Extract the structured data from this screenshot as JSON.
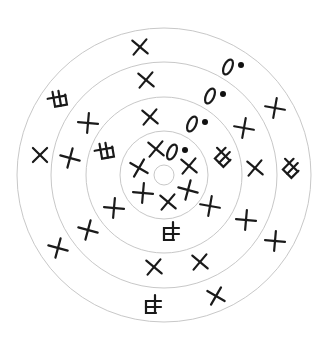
{
  "colors": {
    "ring": "#c8c8c8",
    "mark": "#1a1a1a",
    "background": "#ffffff"
  },
  "center": [
    164,
    175
  ],
  "rings": [
    147,
    113,
    78,
    44,
    10
  ],
  "crosses": [
    {
      "x": 140,
      "y": 47,
      "rot": 40
    },
    {
      "x": 146,
      "y": 80,
      "rot": 40
    },
    {
      "x": 150,
      "y": 117,
      "rot": 40
    },
    {
      "x": 88,
      "y": 123,
      "rot": 5
    },
    {
      "x": 70,
      "y": 158,
      "rot": 15
    },
    {
      "x": 40,
      "y": 155,
      "rot": 45
    },
    {
      "x": 156,
      "y": 149,
      "rot": 40
    },
    {
      "x": 139,
      "y": 168,
      "rot": 30
    },
    {
      "x": 143,
      "y": 193,
      "rot": 5
    },
    {
      "x": 189,
      "y": 166,
      "rot": 40
    },
    {
      "x": 188,
      "y": 190,
      "rot": 15
    },
    {
      "x": 168,
      "y": 202,
      "rot": 40
    },
    {
      "x": 114,
      "y": 208,
      "rot": 5
    },
    {
      "x": 88,
      "y": 230,
      "rot": 15
    },
    {
      "x": 58,
      "y": 248,
      "rot": 15
    },
    {
      "x": 154,
      "y": 267,
      "rot": 40
    },
    {
      "x": 200,
      "y": 262,
      "rot": 40
    },
    {
      "x": 216,
      "y": 296,
      "rot": 30
    },
    {
      "x": 275,
      "y": 108,
      "rot": 10
    },
    {
      "x": 244,
      "y": 128,
      "rot": 10
    },
    {
      "x": 255,
      "y": 168,
      "rot": 40
    },
    {
      "x": 210,
      "y": 206,
      "rot": 10
    },
    {
      "x": 246,
      "y": 220,
      "rot": 5
    },
    {
      "x": 275,
      "y": 241,
      "rot": 5
    }
  ],
  "box_glyphs": [
    {
      "x": 58,
      "y": 100,
      "rot": -10
    },
    {
      "x": 105,
      "y": 152,
      "rot": -10
    },
    {
      "x": 222,
      "y": 157,
      "rot": 45
    },
    {
      "x": 290,
      "y": 168,
      "rot": 45
    },
    {
      "x": 170,
      "y": 232,
      "rot": 90
    },
    {
      "x": 152,
      "y": 305,
      "rot": 90
    }
  ],
  "zero_dots": [
    {
      "x": 232,
      "y": 67
    },
    {
      "x": 214,
      "y": 96
    },
    {
      "x": 196,
      "y": 124
    },
    {
      "x": 176,
      "y": 152
    }
  ]
}
